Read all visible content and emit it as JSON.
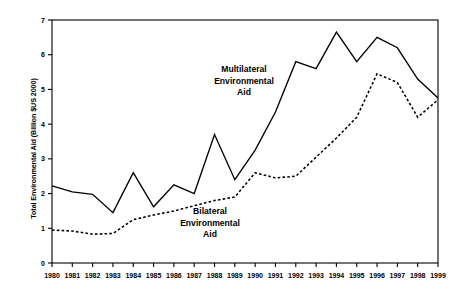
{
  "chart_data": {
    "type": "line",
    "title": "",
    "xlabel": "",
    "ylabel": "Total Environmental Aid (Billion $US 2000)",
    "x": [
      1980,
      1981,
      1982,
      1983,
      1984,
      1985,
      1986,
      1987,
      1988,
      1989,
      1990,
      1991,
      1992,
      1993,
      1994,
      1995,
      1996,
      1997,
      1998,
      1999
    ],
    "categories": [
      "1980",
      "1981",
      "1982",
      "1983",
      "1984",
      "1985",
      "1986",
      "1987",
      "1988",
      "1989",
      "1990",
      "1991",
      "1992",
      "1993",
      "1994",
      "1995",
      "1996",
      "1997",
      "1998",
      "1999"
    ],
    "xlim": [
      1980,
      1999
    ],
    "ylim": [
      0,
      7
    ],
    "yticks": [
      0,
      1,
      2,
      3,
      4,
      5,
      6,
      7
    ],
    "ytick_labels": [
      "0",
      "1",
      "2",
      "3",
      "4",
      "5",
      "6",
      "7"
    ],
    "grid": false,
    "legend": "annotations-inline",
    "series": [
      {
        "name": "Multilateral Environmental Aid",
        "style": "solid",
        "color": "#000000",
        "values": [
          2.22,
          2.05,
          1.98,
          1.45,
          2.6,
          1.62,
          2.25,
          2.0,
          3.7,
          2.4,
          3.25,
          4.35,
          5.8,
          5.6,
          6.65,
          5.8,
          6.5,
          6.2,
          5.3,
          4.75
        ]
      },
      {
        "name": "Bilateral Environmental Aid",
        "style": "dashed",
        "color": "#000000",
        "values": [
          0.95,
          0.92,
          0.83,
          0.85,
          1.25,
          1.38,
          1.5,
          1.65,
          1.8,
          1.9,
          2.6,
          2.45,
          2.5,
          3.05,
          3.6,
          4.2,
          5.45,
          5.2,
          4.2,
          4.7
        ]
      }
    ],
    "annotations": [
      {
        "name": "multilateral-label",
        "lines": [
          "Multilateral",
          "Environmental",
          "Aid"
        ],
        "x_px": 244,
        "y_px": 72
      },
      {
        "name": "bilateral-label",
        "lines": [
          "Bilateral",
          "Environmental",
          "Aid"
        ],
        "x_px": 210,
        "y_px": 214
      }
    ]
  },
  "layout": {
    "plot_left_px": 52,
    "plot_right_px": 438,
    "plot_top_px": 20,
    "plot_bottom_px": 263
  }
}
